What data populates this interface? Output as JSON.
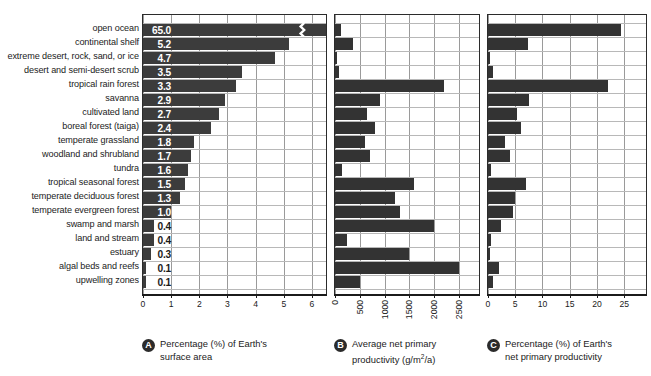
{
  "figure": {
    "background": "#ffffff",
    "bar_color": "#3a3a3a",
    "grid_color": "#9a9a9a",
    "text_color": "#1b1b1b"
  },
  "categories": [
    "open ocean",
    "continental shelf",
    "extreme desert, rock, sand, or ice",
    "desert and semi-desert scrub",
    "tropical rain forest",
    "savanna",
    "cultivated land",
    "boreal forest (taiga)",
    "temperate grassland",
    "woodland and shrubland",
    "tundra",
    "tropical seasonal forest",
    "temperate deciduous forest",
    "temperate evergreen forest",
    "swamp and marsh",
    "land and stream",
    "estuary",
    "algal beds and reefs",
    "upwelling zones"
  ],
  "panelA": {
    "letter": "A",
    "caption_line1": "Percentage (%) of Earth's",
    "caption_line2": "surface area",
    "ticks": [
      "0",
      "1",
      "2",
      "3",
      "4",
      "5",
      "6"
    ],
    "value_labels": [
      "65.0",
      "5.2",
      "4.7",
      "3.5",
      "3.3",
      "2.9",
      "2.7",
      "2.4",
      "1.8",
      "1.7",
      "1.6",
      "1.5",
      "1.3",
      "1.0",
      "0.4",
      "0.4",
      "0.3",
      "0.1",
      "0.1"
    ]
  },
  "panelB": {
    "letter": "B",
    "caption_line1": "Average net primary",
    "caption_line2_pre": "productivity (g/m",
    "caption_line2_sup": "2",
    "caption_line2_post": "/a)",
    "ticks": [
      "0",
      "500",
      "1000",
      "1500",
      "2000",
      "2500"
    ]
  },
  "panelC": {
    "letter": "C",
    "caption_line1": "Percentage (%) of Earth's",
    "caption_line2": "net primary productivity",
    "ticks": [
      "0",
      "5",
      "10",
      "15",
      "20",
      "25"
    ]
  },
  "chart_data": {
    "type": "bar",
    "title": "",
    "orientation": "horizontal",
    "grid": true,
    "legend": "none",
    "categories": [
      "open ocean",
      "continental shelf",
      "extreme desert, rock, sand, or ice",
      "desert and semi-desert scrub",
      "tropical rain forest",
      "savanna",
      "cultivated land",
      "boreal forest (taiga)",
      "temperate grassland",
      "woodland and shrubland",
      "tundra",
      "tropical seasonal forest",
      "temperate deciduous forest",
      "temperate evergreen forest",
      "swamp and marsh",
      "land and stream",
      "estuary",
      "algal beds and reefs",
      "upwelling zones"
    ],
    "panels": [
      {
        "id": "A",
        "label": "Percentage (%) of Earth's surface area",
        "xlabel": "",
        "ylabel": "",
        "xlim": [
          0,
          6.5
        ],
        "xticks": [
          0,
          1,
          2,
          3,
          4,
          5,
          6
        ],
        "axis_break": true,
        "axis_break_note": "open ocean bar (65.0) is truncated with a break symbol",
        "values": [
          65.0,
          5.2,
          4.7,
          3.5,
          3.3,
          2.9,
          2.7,
          2.4,
          1.8,
          1.7,
          1.6,
          1.5,
          1.3,
          1.0,
          0.4,
          0.4,
          0.3,
          0.1,
          0.1
        ],
        "data_labels": [
          "65.0",
          "5.2",
          "4.7",
          "3.5",
          "3.3",
          "2.9",
          "2.7",
          "2.4",
          "1.8",
          "1.7",
          "1.6",
          "1.5",
          "1.3",
          "1.0",
          "0.4",
          "0.4",
          "0.3",
          "0.1",
          "0.1"
        ]
      },
      {
        "id": "B",
        "label": "Average net primary productivity (g/m2/a)",
        "xlabel": "g/m2/a",
        "ylabel": "",
        "xlim": [
          0,
          2900
        ],
        "xticks": [
          0,
          500,
          1000,
          1500,
          2000,
          2500
        ],
        "values": [
          125,
          360,
          10,
          90,
          2200,
          900,
          650,
          800,
          600,
          700,
          140,
          1600,
          1200,
          1300,
          2000,
          250,
          1500,
          2500,
          500
        ]
      },
      {
        "id": "C",
        "label": "Percentage (%) of Earth's net primary productivity",
        "xlabel": "",
        "ylabel": "",
        "xlim": [
          0,
          29
        ],
        "xticks": [
          0,
          5,
          10,
          15,
          20,
          25
        ],
        "values": [
          24.4,
          7.4,
          0.1,
          0.9,
          22.0,
          7.6,
          5.4,
          6.1,
          3.1,
          4.0,
          0.6,
          7.0,
          5.0,
          4.6,
          2.3,
          0.6,
          0.3,
          2.0,
          1.0,
          0.4
        ]
      }
    ]
  }
}
